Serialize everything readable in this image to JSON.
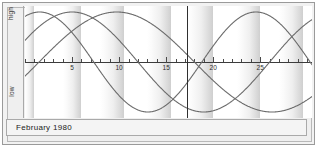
{
  "window": {
    "title": "Biorhythm Chart"
  },
  "axis": {
    "high_label": "high",
    "low_label": "low"
  },
  "footer": {
    "caption": "February 1980"
  },
  "chart_data": {
    "type": "line",
    "title": "February 1980",
    "xlabel": "",
    "ylabel": "",
    "ylim": [
      -1,
      1
    ],
    "xlim": [
      0,
      30.5
    ],
    "grid": false,
    "legend_position": "none",
    "y_axis_labels": [
      "high",
      "low"
    ],
    "x_tick_labels": [
      "5",
      "10",
      "15",
      "20",
      "25"
    ],
    "x_tick_values": [
      5,
      10,
      15,
      20,
      25
    ],
    "x_minor_tick_step": 1,
    "today_marker_x": 17.2,
    "shaded_bands": [
      {
        "start": 0.0,
        "end": 1.0,
        "shaded": true
      },
      {
        "start": 1.0,
        "end": 4.0,
        "shaded": false
      },
      {
        "start": 4.0,
        "end": 6.0,
        "shaded": true
      },
      {
        "start": 6.0,
        "end": 8.0,
        "shaded": false
      },
      {
        "start": 8.0,
        "end": 10.5,
        "shaded": true
      },
      {
        "start": 10.5,
        "end": 13.0,
        "shaded": false
      },
      {
        "start": 13.0,
        "end": 15.5,
        "shaded": true
      },
      {
        "start": 15.5,
        "end": 17.2,
        "shaded": false
      },
      {
        "start": 17.2,
        "end": 20.0,
        "shaded": true
      },
      {
        "start": 20.0,
        "end": 22.5,
        "shaded": false
      },
      {
        "start": 22.5,
        "end": 25.0,
        "shaded": true
      },
      {
        "start": 25.0,
        "end": 27.0,
        "shaded": false
      },
      {
        "start": 27.0,
        "end": 29.5,
        "shaded": true
      },
      {
        "start": 29.5,
        "end": 30.5,
        "shaded": false
      }
    ],
    "series": [
      {
        "name": "physical",
        "period_days": 23,
        "phase_offset_days": 4.2,
        "amplitude": 1.0,
        "color": "#6b6b6b",
        "x": [
          0,
          1,
          2,
          3,
          4,
          5,
          6,
          7,
          8,
          9,
          10,
          11,
          12,
          13,
          14,
          15,
          16,
          17,
          18,
          19,
          20,
          21,
          22,
          23,
          24,
          25,
          26,
          27,
          28,
          29,
          30
        ],
        "values": [
          -0.99,
          -0.94,
          -0.83,
          -0.66,
          -0.45,
          -0.21,
          0.05,
          0.3,
          0.54,
          0.74,
          0.89,
          0.98,
          1.0,
          0.96,
          0.85,
          0.68,
          0.47,
          0.24,
          -0.02,
          -0.27,
          -0.51,
          -0.72,
          -0.88,
          -0.97,
          -1.0,
          -0.96,
          -0.84,
          -0.67,
          -0.45,
          -0.2,
          0.06
        ]
      },
      {
        "name": "emotional",
        "period_days": 28,
        "phase_offset_days": 2.0,
        "amplitude": 1.0,
        "color": "#6b6b6b",
        "x": [
          0,
          1,
          2,
          3,
          4,
          5,
          6,
          7,
          8,
          9,
          10,
          11,
          12,
          13,
          14,
          15,
          16,
          17,
          18,
          19,
          20,
          21,
          22,
          23,
          24,
          25,
          26,
          27,
          28,
          29,
          30
        ],
        "values": [
          -0.43,
          -0.22,
          0.0,
          0.22,
          0.43,
          0.62,
          0.78,
          0.9,
          0.97,
          1.0,
          0.97,
          0.9,
          0.78,
          0.62,
          0.43,
          0.22,
          0.0,
          -0.22,
          -0.43,
          -0.62,
          -0.78,
          -0.9,
          -0.97,
          -1.0,
          -0.97,
          -0.9,
          -0.78,
          -0.62,
          -0.43,
          -0.22,
          0.0
        ]
      },
      {
        "name": "intellectual",
        "period_days": 33,
        "phase_offset_days": -1.5,
        "amplitude": 1.0,
        "color": "#6b6b6b",
        "x": [
          0,
          1,
          2,
          3,
          4,
          5,
          6,
          7,
          8,
          9,
          10,
          11,
          12,
          13,
          14,
          15,
          16,
          17,
          18,
          19,
          20,
          21,
          22,
          23,
          24,
          25,
          26,
          27,
          28,
          29,
          30
        ],
        "values": [
          0.28,
          0.45,
          0.61,
          0.75,
          0.86,
          0.94,
          0.99,
          1.0,
          0.98,
          0.92,
          0.83,
          0.71,
          0.56,
          0.39,
          0.21,
          0.02,
          -0.17,
          -0.36,
          -0.53,
          -0.68,
          -0.81,
          -0.91,
          -0.97,
          -1.0,
          -0.99,
          -0.94,
          -0.86,
          -0.74,
          -0.59,
          -0.43,
          -0.25
        ]
      }
    ]
  }
}
